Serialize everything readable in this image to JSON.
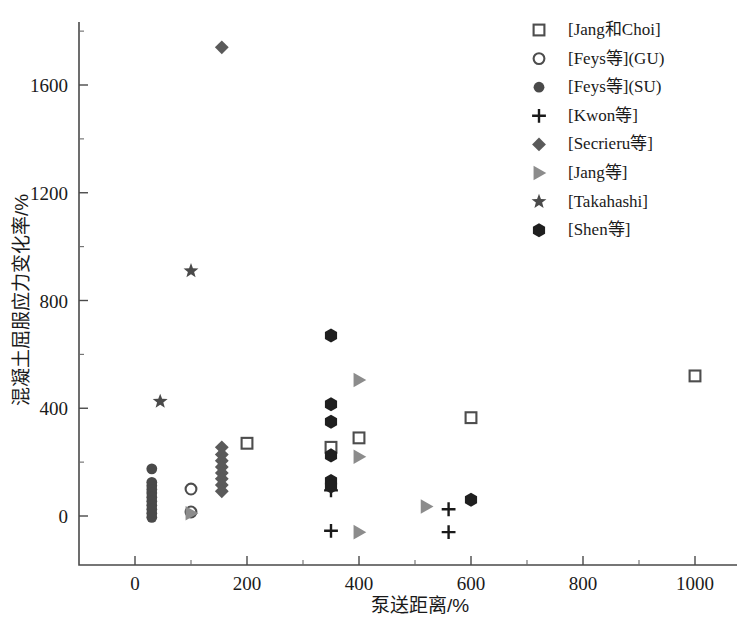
{
  "chart_data": {
    "type": "scatter",
    "title": "",
    "xlabel": "泵送距离/%",
    "ylabel": "混凝土屈服应力变化率/%",
    "xlim": [
      -50,
      1080
    ],
    "ylim": [
      -180,
      1850
    ],
    "xticks": [
      0,
      200,
      400,
      600,
      800,
      1000
    ],
    "yticks": [
      0,
      400,
      800,
      1200,
      1600
    ],
    "xtick_labels": [
      "0",
      "200",
      "400",
      "600",
      "800",
      "1000"
    ],
    "ytick_labels": [
      "0",
      "400",
      "800",
      "1200",
      "1600"
    ],
    "grid": false,
    "legend_position": "top-right",
    "series": [
      {
        "name": "[Jang和Choi]",
        "marker": "open-square",
        "color": "#4d4d4d",
        "points": [
          {
            "x": 200,
            "y": 270
          },
          {
            "x": 350,
            "y": 255
          },
          {
            "x": 400,
            "y": 290
          },
          {
            "x": 600,
            "y": 365
          },
          {
            "x": 1000,
            "y": 520
          }
        ]
      },
      {
        "name": "[Feys等](GU)",
        "marker": "open-circle",
        "color": "#4d4d4d",
        "points": [
          {
            "x": 100,
            "y": 100
          },
          {
            "x": 100,
            "y": 15
          }
        ]
      },
      {
        "name": "[Feys等](SU)",
        "marker": "filled-circle",
        "color": "#4a4a4a",
        "points": [
          {
            "x": 30,
            "y": 175
          },
          {
            "x": 30,
            "y": 125
          },
          {
            "x": 30,
            "y": 112
          },
          {
            "x": 30,
            "y": 98
          },
          {
            "x": 30,
            "y": 85
          },
          {
            "x": 30,
            "y": 70
          },
          {
            "x": 30,
            "y": 55
          },
          {
            "x": 30,
            "y": 40
          },
          {
            "x": 30,
            "y": 25
          },
          {
            "x": 30,
            "y": 10
          },
          {
            "x": 30,
            "y": -5
          }
        ]
      },
      {
        "name": "[Kwon等]",
        "marker": "plus",
        "color": "#1a1a1a",
        "points": [
          {
            "x": 350,
            "y": 95
          },
          {
            "x": 350,
            "y": -55
          },
          {
            "x": 560,
            "y": 25
          },
          {
            "x": 560,
            "y": -60
          }
        ]
      },
      {
        "name": "[Secrieru等]",
        "marker": "filled-diamond",
        "color": "#5a5a5a",
        "points": [
          {
            "x": 155,
            "y": 1740
          },
          {
            "x": 155,
            "y": 255
          },
          {
            "x": 155,
            "y": 228
          },
          {
            "x": 155,
            "y": 205
          },
          {
            "x": 155,
            "y": 182
          },
          {
            "x": 155,
            "y": 160
          },
          {
            "x": 155,
            "y": 138
          },
          {
            "x": 155,
            "y": 115
          },
          {
            "x": 155,
            "y": 92
          }
        ]
      },
      {
        "name": "[Jang等]",
        "marker": "filled-right-triangle",
        "color": "#8c8c8c",
        "points": [
          {
            "x": 100,
            "y": 10
          },
          {
            "x": 400,
            "y": 505
          },
          {
            "x": 400,
            "y": 220
          },
          {
            "x": 400,
            "y": -60
          },
          {
            "x": 520,
            "y": 35
          }
        ]
      },
      {
        "name": "[Takahashi]",
        "marker": "filled-star",
        "color": "#4a4a4a",
        "points": [
          {
            "x": 100,
            "y": 910
          },
          {
            "x": 45,
            "y": 425
          }
        ]
      },
      {
        "name": "[Shen等]",
        "marker": "filled-hexagon",
        "color": "#1f1f1f",
        "points": [
          {
            "x": 350,
            "y": 670
          },
          {
            "x": 350,
            "y": 415
          },
          {
            "x": 350,
            "y": 350
          },
          {
            "x": 350,
            "y": 225
          },
          {
            "x": 350,
            "y": 130
          },
          {
            "x": 350,
            "y": 110
          },
          {
            "x": 600,
            "y": 60
          }
        ]
      }
    ]
  }
}
